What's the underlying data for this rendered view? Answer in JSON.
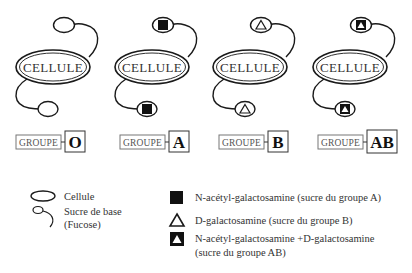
{
  "diagram": {
    "cell_label": "CELLULE",
    "groupe_label": "GROUPE",
    "cells": [
      {
        "group": "O",
        "sugar": "none"
      },
      {
        "group": "A",
        "sugar": "n-acetyl-galactosamine"
      },
      {
        "group": "B",
        "sugar": "d-galactosamine"
      },
      {
        "group": "AB",
        "sugar": "both"
      }
    ]
  },
  "legend": {
    "items": [
      {
        "symbol": "ellipse-outline",
        "label": "Cellule"
      },
      {
        "symbol": "circle-with-tail",
        "label": "Sucre de base",
        "sublabel": "(Fucose)"
      },
      {
        "symbol": "filled-black-square",
        "label": "N-acétyl-galactosamine (sucre du groupe A)"
      },
      {
        "symbol": "outline-triangle",
        "label": "D-galactosamine (sucre du groupe B)"
      },
      {
        "symbol": "black-square-white-triangle",
        "label": "N-acétyl-galactosamine +D-galactosamine",
        "sublabel": "(sucre du groupe AB)"
      }
    ]
  },
  "colors": {
    "stroke": "#1a1a1a",
    "fill_dark": "#111111",
    "text": "#333333",
    "background": "#ffffff"
  }
}
